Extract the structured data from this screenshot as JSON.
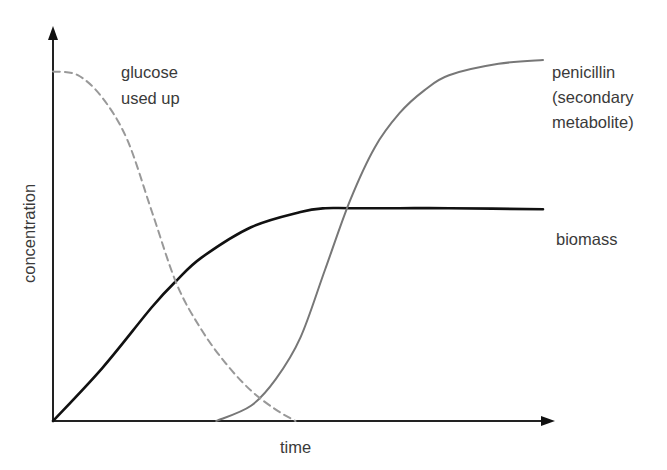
{
  "chart_data": {
    "type": "line",
    "title": "",
    "xlabel": "time",
    "ylabel": "concentration",
    "grid": false,
    "ticks": "none",
    "x_range": [
      0,
      100
    ],
    "y_range": [
      0,
      100
    ],
    "series": [
      {
        "name": "biomass",
        "label": "biomass",
        "style": "solid",
        "color": "#111111",
        "x": [
          0,
          10,
          20,
          25,
          30,
          40,
          50,
          55,
          60,
          70,
          80,
          99
        ],
        "y": [
          0,
          14,
          30,
          37,
          43,
          51,
          55,
          56,
          56,
          56,
          56,
          55.7
        ]
      },
      {
        "name": "penicillin",
        "label_lines": [
          "penicillin",
          "(secondary",
          "metabolite)"
        ],
        "style": "solid",
        "color": "#777777",
        "x": [
          33,
          40,
          45,
          50,
          55,
          60,
          65,
          70,
          75,
          80,
          90,
          99
        ],
        "y": [
          0,
          4,
          11,
          22,
          40,
          58,
          72,
          81,
          87,
          91,
          94,
          95
        ]
      },
      {
        "name": "glucose",
        "label_lines": [
          "glucose",
          "used up"
        ],
        "style": "dashed",
        "color": "#999999",
        "x": [
          0,
          5,
          10,
          15,
          20,
          25,
          30,
          35,
          40,
          45,
          49
        ],
        "y": [
          92,
          91,
          85,
          74,
          55,
          36,
          24,
          15,
          8,
          3,
          0
        ]
      }
    ]
  },
  "labels": {
    "glucose_line1": "glucose",
    "glucose_line2": "used up",
    "penicillin_line1": "penicillin",
    "penicillin_line2": "(secondary",
    "penicillin_line3": "metabolite)",
    "biomass": "biomass",
    "x_axis": "time",
    "y_axis": "concentration"
  }
}
